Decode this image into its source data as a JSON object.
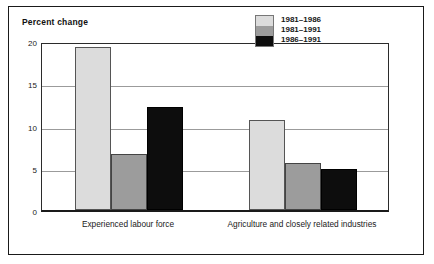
{
  "figure": {
    "title": "Percent change"
  },
  "chart_data": {
    "type": "bar",
    "title": "Percent change",
    "xlabel": "",
    "ylabel": "Percent change",
    "ylim": [
      0,
      20
    ],
    "yticks": [
      0,
      5,
      10,
      15,
      20
    ],
    "ytick_labels": [
      "0",
      "5",
      "10",
      "15",
      "20"
    ],
    "grid": true,
    "legend_position": "top-right",
    "categories": [
      "Experienced labour force",
      "Agriculture and closely related industries"
    ],
    "series": [
      {
        "name": "1981–1986",
        "color": "#dcdcdc",
        "values": [
          19.3,
          10.7
        ]
      },
      {
        "name": "1981–1991",
        "color": "#9c9c9c",
        "values": [
          6.6,
          5.6
        ]
      },
      {
        "name": "1986–1991",
        "color": "#0d0d0d",
        "values": [
          12.2,
          4.8
        ]
      }
    ]
  }
}
